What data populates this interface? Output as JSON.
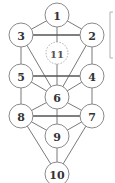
{
  "diagram": {
    "type": "node-graph",
    "colors": {
      "node_stroke": "#8a8a8a",
      "edge": "#6a6a6a",
      "label": "#333333",
      "background": "#ffffff"
    },
    "nodes": [
      {
        "id": "1",
        "label": "1",
        "x": 57,
        "y": 15,
        "style": "solid"
      },
      {
        "id": "2",
        "label": "2",
        "x": 92,
        "y": 35,
        "style": "solid"
      },
      {
        "id": "3",
        "label": "3",
        "x": 21,
        "y": 35,
        "style": "solid"
      },
      {
        "id": "4",
        "label": "4",
        "x": 92,
        "y": 76,
        "style": "solid"
      },
      {
        "id": "5",
        "label": "5",
        "x": 21,
        "y": 76,
        "style": "solid"
      },
      {
        "id": "6",
        "label": "6",
        "x": 57,
        "y": 97,
        "style": "solid"
      },
      {
        "id": "7",
        "label": "7",
        "x": 92,
        "y": 116,
        "style": "solid"
      },
      {
        "id": "8",
        "label": "8",
        "x": 21,
        "y": 116,
        "style": "solid"
      },
      {
        "id": "9",
        "label": "9",
        "x": 57,
        "y": 136,
        "style": "solid"
      },
      {
        "id": "10",
        "label": "10",
        "x": 57,
        "y": 174,
        "style": "solid"
      },
      {
        "id": "11",
        "label": "11",
        "x": 57,
        "y": 53,
        "style": "dashed"
      }
    ],
    "edges": [
      [
        "1",
        "2"
      ],
      [
        "1",
        "3"
      ],
      [
        "1",
        "6"
      ],
      [
        "2",
        "3",
        "bold"
      ],
      [
        "2",
        "4"
      ],
      [
        "2",
        "6"
      ],
      [
        "3",
        "5"
      ],
      [
        "3",
        "6"
      ],
      [
        "4",
        "5",
        "bold"
      ],
      [
        "4",
        "6"
      ],
      [
        "4",
        "7"
      ],
      [
        "5",
        "6"
      ],
      [
        "5",
        "8"
      ],
      [
        "6",
        "7"
      ],
      [
        "6",
        "8"
      ],
      [
        "6",
        "9"
      ],
      [
        "7",
        "8",
        "bold"
      ],
      [
        "7",
        "9"
      ],
      [
        "7",
        "10"
      ],
      [
        "8",
        "9"
      ],
      [
        "8",
        "10"
      ],
      [
        "9",
        "10"
      ]
    ],
    "bracket": {
      "x": 110,
      "y1": 12,
      "y2": 58
    }
  }
}
